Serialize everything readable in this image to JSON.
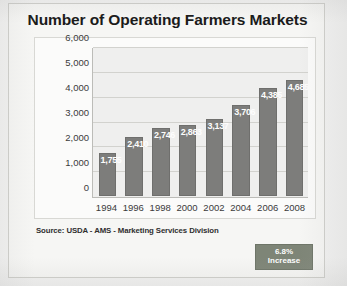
{
  "chart_data": {
    "type": "bar",
    "title": "Number of Operating Farmers Markets",
    "xlabel": "",
    "ylabel": "",
    "categories": [
      "1994",
      "1996",
      "1998",
      "2000",
      "2002",
      "2004",
      "2006",
      "2008"
    ],
    "values": [
      1755,
      2410,
      2746,
      2863,
      3137,
      3706,
      4385,
      4685
    ],
    "data_labels": [
      "1,755",
      "2,410",
      "2,746",
      "2,863",
      "3,137",
      "3,706",
      "4,385",
      "4,685"
    ],
    "ylim": [
      0,
      6000
    ],
    "ytick_values": [
      6000,
      5000,
      4000,
      3000,
      2000,
      1000,
      0
    ],
    "ytick_labels": [
      "6,000",
      "5,000",
      "4,000",
      "3,000",
      "2,000",
      "1,000",
      "0"
    ],
    "grid": true,
    "legend": "none",
    "bar_color": "#7d7d7b",
    "plot_background": "#efefee",
    "data_label_color": "#fdfdfd"
  },
  "footer": {
    "source": "Source: USDA - AMS - Marketing Services Division"
  },
  "callout": {
    "value": "6.8%",
    "label": "Increase",
    "background_color": "#7e8577",
    "text_color": "#fdfdfd"
  }
}
